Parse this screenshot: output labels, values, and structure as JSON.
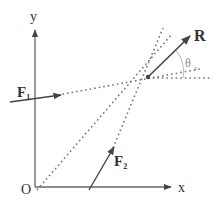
{
  "diagram": {
    "type": "force-resultant",
    "colors": {
      "line": "#444444",
      "dash": "#777777",
      "text": "#333333",
      "angle_arc": "#bbbbbb"
    },
    "axes": {
      "x_label": "x",
      "y_label": "y",
      "origin_label": "O"
    },
    "forces": [
      {
        "id": "F1",
        "label": "F",
        "subscript": "1"
      },
      {
        "id": "F2",
        "label": "F",
        "subscript": "2"
      }
    ],
    "resultant": {
      "label": "R"
    },
    "angle": {
      "symbol": "θ",
      "subscript": "x"
    }
  }
}
